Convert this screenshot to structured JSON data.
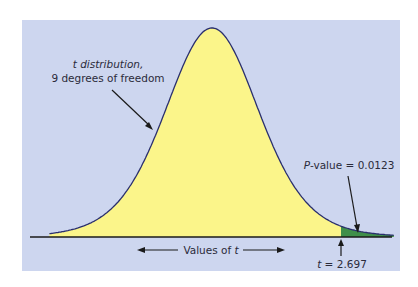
{
  "chart_data": {
    "type": "area",
    "title": "",
    "distribution": "t",
    "degrees_of_freedom": 9,
    "x_range": [
      -3.4,
      3.8
    ],
    "shaded_region": {
      "from": 2.697,
      "to": 3.8,
      "label": "P-value",
      "value": 0.0123
    },
    "test_statistic": 2.697,
    "xlabel": "Values of t",
    "ylabel": "",
    "grid": false,
    "legend": null,
    "annotations": [
      {
        "text_line1": "t distribution,",
        "text_line2": "9 degrees of freedom",
        "points_to": "curve left shoulder"
      },
      {
        "text": "P-value = 0.0123",
        "points_to": "right tail area beyond t = 2.697"
      },
      {
        "text": "t = 2.697",
        "points_to": "test statistic on axis"
      }
    ]
  },
  "labels": {
    "curve_line1": "t distribution,",
    "curve_line2": "9 degrees of freedom",
    "pvalue_prefix": "P",
    "pvalue_rest": "-value = 0.0123",
    "axis_prefix": "Values of ",
    "axis_var": "t",
    "tstat_var": "t",
    "tstat_rest": " = 2.697"
  },
  "colors": {
    "panel_bg": "#cdd6ef",
    "curve_fill": "#fbf58a",
    "tail_fill": "#3f8f4a",
    "curve_stroke": "#2a2f6e",
    "axis": "#1a1a1a",
    "arrow": "#1a1a1a"
  }
}
